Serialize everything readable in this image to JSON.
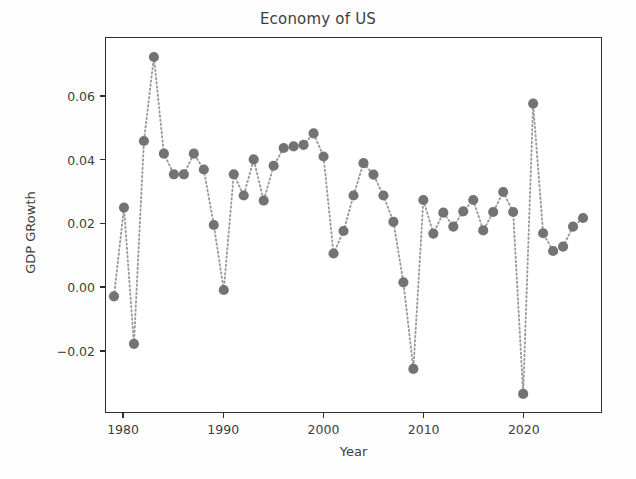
{
  "chart_data": {
    "type": "scatter",
    "title": "Economy of US",
    "xlabel": "Year",
    "ylabel": "GDP GRowth",
    "grid": false,
    "legend": null,
    "line_style": "dotted",
    "marker": "circle",
    "marker_color": "#737373",
    "line_color": "#9a9a9a",
    "xlim": [
      1978.2,
      2027.8
    ],
    "ylim": [
      -0.0395,
      0.0785
    ],
    "xticks": [
      1980,
      1990,
      2000,
      2010,
      2020
    ],
    "xtick_labels": [
      "1980",
      "1990",
      "2000",
      "2010",
      "2020"
    ],
    "yticks": [
      -0.02,
      0.0,
      0.02,
      0.04,
      0.06
    ],
    "ytick_labels": [
      "−0.02",
      "0.00",
      "0.02",
      "0.04",
      "0.06"
    ],
    "x": [
      1979,
      1980,
      1981,
      1982,
      1983,
      1984,
      1985,
      1986,
      1987,
      1988,
      1989,
      1990,
      1991,
      1992,
      1993,
      1994,
      1995,
      1996,
      1997,
      1998,
      1999,
      2000,
      2001,
      2002,
      2003,
      2004,
      2005,
      2006,
      2007,
      2008,
      2009,
      2010,
      2011,
      2012,
      2013,
      2014,
      2015,
      2016,
      2017,
      2018,
      2019,
      2020,
      2021,
      2022,
      2023,
      2024,
      2025,
      2026
    ],
    "y": [
      -0.003,
      0.025,
      -0.018,
      0.046,
      0.0725,
      0.042,
      0.0355,
      0.0355,
      0.042,
      0.037,
      0.0195,
      -0.001,
      0.0355,
      0.0288,
      0.0402,
      0.0272,
      0.0382,
      0.0438,
      0.0443,
      0.0448,
      0.0484,
      0.0411,
      0.0105,
      0.0176,
      0.0288,
      0.039,
      0.0354,
      0.0288,
      0.0205,
      0.0014,
      -0.0259,
      0.0274,
      0.0168,
      0.0234,
      0.019,
      0.0238,
      0.0274,
      0.0178,
      0.0236,
      0.0299,
      0.0236,
      -0.0338,
      0.0578,
      0.0169,
      0.0113,
      0.0127,
      0.019,
      0.0217
    ],
    "points": [
      {
        "year": 1979,
        "value": -0.003
      },
      {
        "year": 1980,
        "value": 0.025
      },
      {
        "year": 1981,
        "value": -0.018
      },
      {
        "year": 1982,
        "value": 0.046
      },
      {
        "year": 1983,
        "value": 0.0725
      },
      {
        "year": 1984,
        "value": 0.042
      },
      {
        "year": 1985,
        "value": 0.0355
      },
      {
        "year": 1986,
        "value": 0.0355
      },
      {
        "year": 1987,
        "value": 0.042
      },
      {
        "year": 1988,
        "value": 0.037
      },
      {
        "year": 1989,
        "value": 0.0195
      },
      {
        "year": 1990,
        "value": -0.001
      },
      {
        "year": 1991,
        "value": 0.0355
      },
      {
        "year": 1992,
        "value": 0.0288
      },
      {
        "year": 1993,
        "value": 0.0402
      },
      {
        "year": 1994,
        "value": 0.0272
      },
      {
        "year": 1995,
        "value": 0.0382
      },
      {
        "year": 1996,
        "value": 0.0438
      },
      {
        "year": 1997,
        "value": 0.0443
      },
      {
        "year": 1998,
        "value": 0.0448
      },
      {
        "year": 1999,
        "value": 0.0484
      },
      {
        "year": 2000,
        "value": 0.0411
      },
      {
        "year": 2001,
        "value": 0.0105
      },
      {
        "year": 2002,
        "value": 0.0176
      },
      {
        "year": 2003,
        "value": 0.0288
      },
      {
        "year": 2004,
        "value": 0.039
      },
      {
        "year": 2005,
        "value": 0.0354
      },
      {
        "year": 2006,
        "value": 0.0288
      },
      {
        "year": 2007,
        "value": 0.0205
      },
      {
        "year": 2008,
        "value": 0.0014
      },
      {
        "year": 2009,
        "value": -0.0259
      },
      {
        "year": 2010,
        "value": 0.0274
      },
      {
        "year": 2011,
        "value": 0.0168
      },
      {
        "year": 2012,
        "value": 0.0234
      },
      {
        "year": 2013,
        "value": 0.019
      },
      {
        "year": 2014,
        "value": 0.0238
      },
      {
        "year": 2015,
        "value": 0.0274
      },
      {
        "year": 2016,
        "value": 0.0178
      },
      {
        "year": 2017,
        "value": 0.0236
      },
      {
        "year": 2018,
        "value": 0.0299
      },
      {
        "year": 2019,
        "value": 0.0236
      },
      {
        "year": 2020,
        "value": -0.0338
      },
      {
        "year": 2021,
        "value": 0.0578
      },
      {
        "year": 2022,
        "value": 0.0169
      },
      {
        "year": 2023,
        "value": 0.0113
      },
      {
        "year": 2024,
        "value": 0.0127
      },
      {
        "year": 2025,
        "value": 0.019
      },
      {
        "year": 2026,
        "value": 0.0217
      }
    ]
  }
}
